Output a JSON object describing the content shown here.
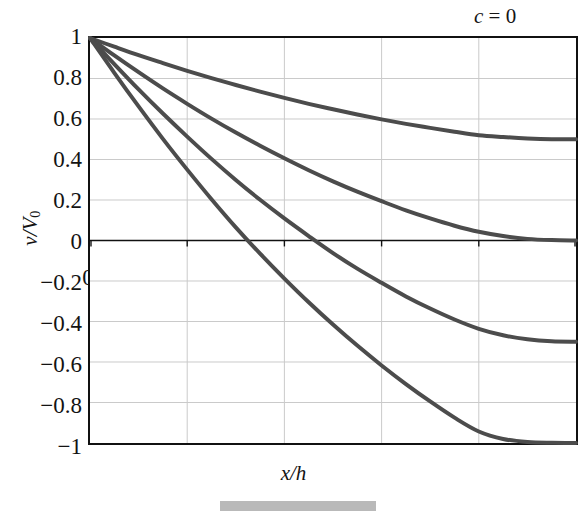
{
  "chart_data": {
    "type": "line",
    "title": "",
    "subtitle": "",
    "xlabel": "x/h",
    "ylabel": "v/V0",
    "ylabel_parts": {
      "numerator": "v",
      "denominator": "V",
      "subscript": "0"
    },
    "xlim": [
      0,
      1
    ],
    "ylim": [
      -1,
      1
    ],
    "xticks": [
      "0",
      "0.2",
      "0.4",
      "0.6",
      "0.8",
      "1"
    ],
    "xtick_values": [
      0,
      0.2,
      0.4,
      0.6,
      0.8,
      1
    ],
    "yticks": [
      "1",
      "0.8",
      "0.6",
      "0.4",
      "0.2",
      "0",
      "−0.2",
      "−0.4",
      "−0.6",
      "−0.8",
      "−1"
    ],
    "ytick_values": [
      1,
      0.8,
      0.6,
      0.4,
      0.2,
      0,
      -0.2,
      -0.4,
      -0.6,
      -0.8,
      -1
    ],
    "grid": true,
    "grid_color": "#c9c9c9",
    "axis_color": "#111111",
    "curve_color": "#4c4c4c",
    "legend_position": "inline-right",
    "annotations": [
      {
        "text": "c = 0",
        "c": 0,
        "x": 0.82,
        "y": 1.1
      },
      {
        "text": "c = 0.5",
        "c": 0.5,
        "x": 0.8,
        "y": 0.56
      },
      {
        "text": "c = 1.0",
        "c": 1.0,
        "x": 0.8,
        "y": 0.1
      },
      {
        "text": "c = 1.5",
        "c": 1.5,
        "x": 0.8,
        "y": -0.4
      },
      {
        "text": "c = 2.0",
        "c": 2.0,
        "x": 0.8,
        "y": -0.84
      }
    ],
    "series": [
      {
        "name": "c = 0",
        "c": 0,
        "label": "c = 0",
        "x": [
          0,
          0.1,
          0.2,
          0.3,
          0.4,
          0.5,
          0.6,
          0.7,
          0.8,
          0.9,
          1.0
        ],
        "values": [
          1,
          1,
          1,
          1,
          1,
          1,
          1,
          1,
          1,
          1,
          1
        ]
      },
      {
        "name": "c = 0.5",
        "c": 0.5,
        "label": "c = 0.5",
        "x": [
          0,
          0.05,
          0.1,
          0.15,
          0.2,
          0.25,
          0.3,
          0.35,
          0.4,
          0.45,
          0.5,
          0.55,
          0.6,
          0.65,
          0.7,
          0.75,
          0.8,
          0.85,
          0.9,
          0.95,
          1.0
        ],
        "values": [
          1.0,
          0.957,
          0.915,
          0.876,
          0.838,
          0.802,
          0.768,
          0.735,
          0.704,
          0.675,
          0.648,
          0.622,
          0.598,
          0.576,
          0.556,
          0.537,
          0.52,
          0.511,
          0.504,
          0.5,
          0.5
        ]
      },
      {
        "name": "c = 1.0",
        "c": 1.0,
        "label": "c = 1.0",
        "x": [
          0,
          0.05,
          0.1,
          0.15,
          0.2,
          0.25,
          0.3,
          0.35,
          0.4,
          0.45,
          0.5,
          0.55,
          0.6,
          0.65,
          0.7,
          0.75,
          0.8,
          0.85,
          0.9,
          0.95,
          1.0
        ],
        "values": [
          1.0,
          0.914,
          0.831,
          0.751,
          0.675,
          0.602,
          0.533,
          0.468,
          0.406,
          0.347,
          0.292,
          0.241,
          0.194,
          0.149,
          0.109,
          0.073,
          0.043,
          0.022,
          0.008,
          0.002,
          0.0
        ]
      },
      {
        "name": "c = 1.5",
        "c": 1.5,
        "label": "c = 1.5",
        "x": [
          0,
          0.05,
          0.1,
          0.15,
          0.2,
          0.25,
          0.3,
          0.35,
          0.4,
          0.45,
          0.5,
          0.55,
          0.6,
          0.65,
          0.7,
          0.75,
          0.8,
          0.85,
          0.9,
          0.95,
          1.0
        ],
        "values": [
          1.0,
          0.871,
          0.746,
          0.627,
          0.513,
          0.403,
          0.299,
          0.201,
          0.109,
          0.022,
          -0.062,
          -0.139,
          -0.209,
          -0.276,
          -0.336,
          -0.39,
          -0.436,
          -0.468,
          -0.488,
          -0.498,
          -0.5
        ]
      },
      {
        "name": "c = 2.0",
        "c": 2.0,
        "label": "c = 2.0",
        "x": [
          0,
          0.05,
          0.1,
          0.15,
          0.2,
          0.25,
          0.3,
          0.35,
          0.4,
          0.45,
          0.5,
          0.55,
          0.6,
          0.65,
          0.7,
          0.75,
          0.8,
          0.85,
          0.9,
          0.95,
          1.0
        ],
        "values": [
          1.0,
          0.828,
          0.662,
          0.502,
          0.35,
          0.204,
          0.065,
          -0.065,
          -0.188,
          -0.305,
          -0.415,
          -0.519,
          -0.617,
          -0.709,
          -0.795,
          -0.875,
          -0.943,
          -0.98,
          -0.995,
          -0.999,
          -1.0
        ]
      }
    ]
  },
  "figure": {
    "xlabel": "x/h",
    "ylabel_numerator": "v",
    "ylabel_slash": "/",
    "ylabel_denominator": "V",
    "ylabel_subscript": "0",
    "ytick_1": "1",
    "ytick_2": "0.8",
    "ytick_3": "0.6",
    "ytick_4": "0.4",
    "ytick_5": "0.2",
    "ytick_6": "0",
    "ytick_7": "−0.2",
    "ytick_8": "−0.4",
    "ytick_9": "−0.6",
    "ytick_10": "−0.8",
    "ytick_11": "−1",
    "xtick_1": "0",
    "xtick_2": "0.2",
    "xtick_3": "0.4",
    "xtick_4": "0.6",
    "xtick_5": "0.8",
    "xtick_6": "1",
    "label_c0": "c = 0",
    "label_c05": "c = 0.5",
    "label_c10": "c = 1.0",
    "label_c15": "c = 1.5",
    "label_c20": "c = 2.0"
  }
}
